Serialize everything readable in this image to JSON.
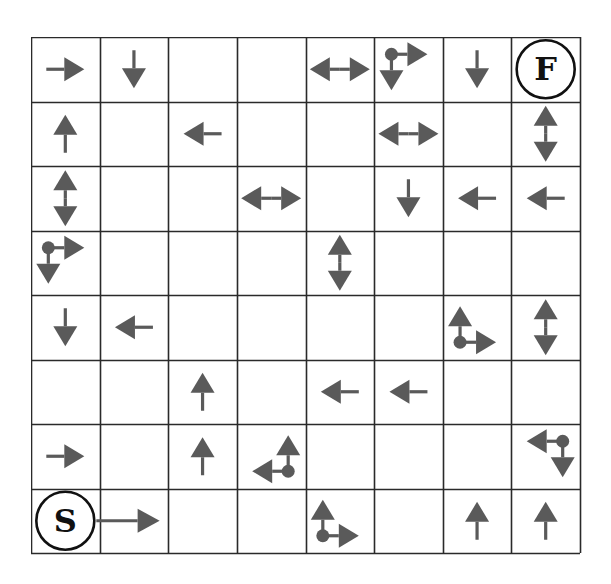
{
  "puzzle": {
    "title": "",
    "rows": 8,
    "cols": 8,
    "colors": {
      "grid_line": "#2a2a2a",
      "arrow": "#5a5a5a",
      "circle": "#111111",
      "background": "#ffffff"
    },
    "start": {
      "row": 7,
      "col": 0,
      "label": "S"
    },
    "finish": {
      "row": 0,
      "col": 7,
      "label": "F"
    },
    "cells": [
      [
        "right",
        "down",
        "",
        "",
        "left-right",
        "corner:tl:right,down",
        "down",
        "finish"
      ],
      [
        "up",
        "",
        "left",
        "",
        "",
        "left-right",
        "",
        "up-down"
      ],
      [
        "up-down",
        "",
        "",
        "left-right",
        "",
        "down",
        "left",
        "left"
      ],
      [
        "corner:tl:right,down",
        "",
        "",
        "",
        "up-down",
        "",
        "",
        ""
      ],
      [
        "down",
        "left",
        "",
        "",
        "",
        "",
        "corner:bl:up,right",
        "up-down"
      ],
      [
        "",
        "",
        "up",
        "",
        "left",
        "left",
        "",
        ""
      ],
      [
        "right",
        "",
        "up",
        "corner:br:up,left",
        "",
        "",
        "",
        "corner:tr:left,down"
      ],
      [
        "start-right",
        "",
        "",
        "",
        "corner:bl:up,right",
        "",
        "up",
        "up"
      ]
    ],
    "legend": {
      "right": "right-arrow-icon",
      "left": "left-arrow-icon",
      "up": "up-arrow-icon",
      "down": "down-arrow-icon",
      "left-right": "left-right-arrow-icon",
      "up-down": "up-down-arrow-icon",
      "corner": "pivot-corner-arrow-icon"
    }
  }
}
